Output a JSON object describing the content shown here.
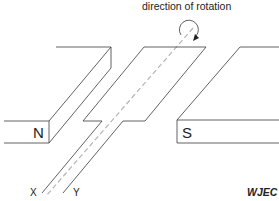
{
  "diagram": {
    "title_annotation": "direction of rotation",
    "magnets": {
      "north": {
        "label": "N"
      },
      "south": {
        "label": "S"
      }
    },
    "coil": {
      "terminals": [
        {
          "label": "X"
        },
        {
          "label": "Y"
        }
      ],
      "axis": "rotation axis (dashed)"
    },
    "rotation_arrow": "clockwise",
    "credit": "WJEC"
  },
  "colors": {
    "line": "#3a3a3a",
    "axis_dash": "#b5b5b5",
    "background": "#ffffff"
  }
}
